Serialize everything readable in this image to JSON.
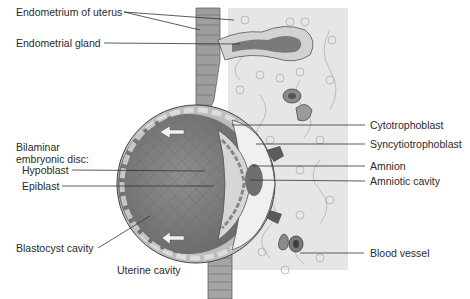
{
  "figure": {
    "labels_left": {
      "endometrium": "Endometrium of uterus",
      "endometrial_gland": "Endometrial gland",
      "bilaminar_line1": "Bilaminar",
      "bilaminar_line2": "embryonic disc:",
      "hypoblast": "Hypoblast",
      "epiblast": "Epiblast",
      "blastocyst_cavity": "Blastocyst cavity",
      "uterine_cavity": "Uterine cavity"
    },
    "labels_right": {
      "cytotrophoblast": "Cytotrophoblast",
      "syncytiotrophoblast": "Syncytiotrophoblast",
      "amnion": "Amnion",
      "amniotic_cavity": "Amniotic cavity",
      "blood_vessel": "Blood vessel"
    },
    "colors": {
      "stroma": "#e4e4e4",
      "epithelium": "#9a9a9a",
      "blastocyst_cavity": "#7d7d7d",
      "disc": "#c8c8c8",
      "leader_line": "#333333"
    }
  }
}
